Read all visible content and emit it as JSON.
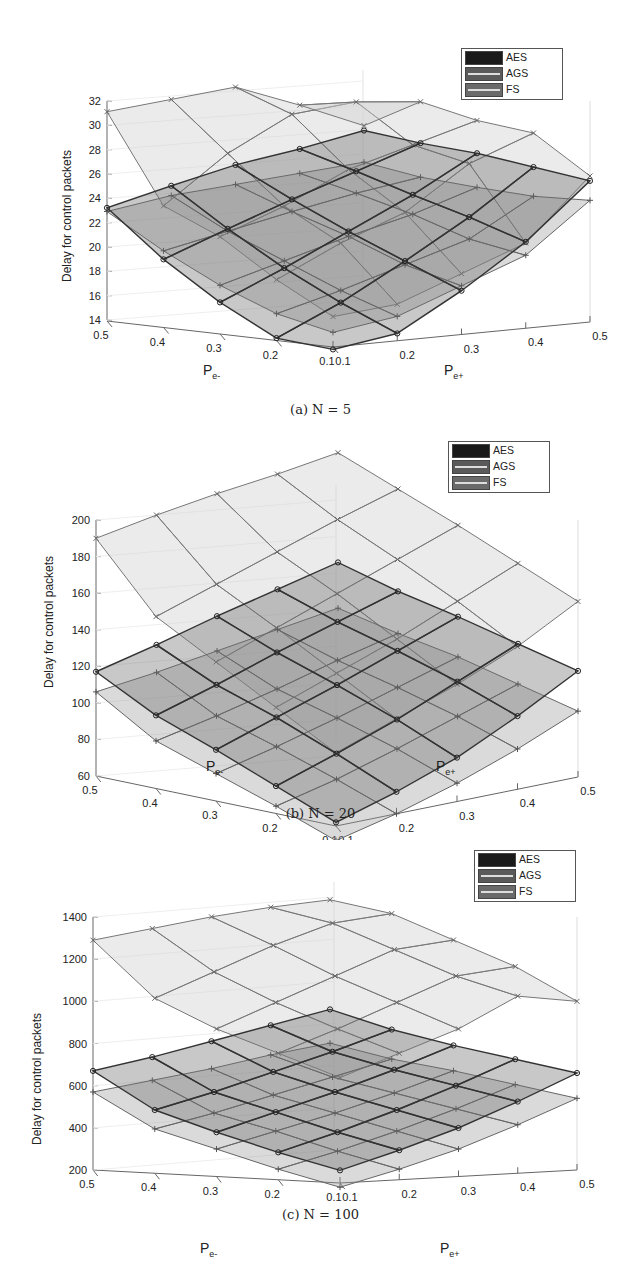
{
  "figure": {
    "panels": [
      {
        "caption": "(a) N = 5",
        "zlabel": "Delay for control packets",
        "xlabel": "P",
        "xlabel_sub": "e-",
        "ylabel": "P",
        "ylabel_sub": "e+",
        "zticks": [
          "32",
          "30",
          "28",
          "26",
          "24",
          "22",
          "20",
          "18",
          "16",
          "14"
        ],
        "xticks": [
          "0.5",
          "0.4",
          "0.3",
          "0.2",
          "0.1"
        ],
        "yticks": [
          "0.1",
          "0.2",
          "0.3",
          "0.4",
          "0.5"
        ],
        "legend": [
          "AES",
          "AGS",
          "FS"
        ]
      },
      {
        "caption": "(b) N = 20",
        "zlabel": "Delay for control packets",
        "xlabel": "P",
        "xlabel_sub": "e-",
        "ylabel": "P",
        "ylabel_sub": "e+",
        "zticks": [
          "200",
          "180",
          "160",
          "140",
          "120",
          "100",
          "80",
          "60"
        ],
        "xticks": [
          "0.5",
          "0.4",
          "0.3",
          "0.2",
          "0.1"
        ],
        "yticks": [
          "0.1",
          "0.2",
          "0.3",
          "0.4",
          "0.5"
        ],
        "legend": [
          "AES",
          "AGS",
          "FS"
        ]
      },
      {
        "caption": "(c) N = 100",
        "zlabel": "Delay for control packets",
        "xlabel": "P",
        "xlabel_sub": "e-",
        "ylabel": "P",
        "ylabel_sub": "e+",
        "zticks": [
          "1400",
          "1200",
          "1000",
          "800",
          "600",
          "400",
          "200"
        ],
        "xticks": [
          "0.5",
          "0.4",
          "0.3",
          "0.2",
          "0.1"
        ],
        "yticks": [
          "0.1",
          "0.2",
          "0.3",
          "0.4",
          "0.5"
        ],
        "legend": [
          "AES",
          "AGS",
          "FS"
        ]
      }
    ]
  },
  "chart_data": [
    {
      "type": "surface3d",
      "title": "(a) N = 5",
      "xlabel": "P_e-",
      "ylabel": "P_e+",
      "zlabel": "Delay for control packets",
      "x": [
        0.1,
        0.2,
        0.3,
        0.4,
        0.5
      ],
      "y": [
        0.1,
        0.2,
        0.3,
        0.4,
        0.5
      ],
      "zlim": [
        14,
        32
      ],
      "legend_position": "top-right",
      "grid": true,
      "series": [
        {
          "name": "AES",
          "marker": "o",
          "color": "#555555",
          "z": [
            [
              13.8,
              14.6,
              17.6,
              21.1,
              25.6
            ],
            [
              14.2,
              16.6,
              19.5,
              22.6,
              26.2
            ],
            [
              16.6,
              18.9,
              21.4,
              23.9,
              26.8
            ],
            [
              19.6,
              21.6,
              23.5,
              25.3,
              27.1
            ],
            [
              23.3,
              24.6,
              25.8,
              26.6,
              27.6
            ]
          ]
        },
        {
          "name": "AGS",
          "marker": "+",
          "color": "#777777",
          "z": [
            [
              15.2,
              16.0,
              18.0,
              20.0,
              24.0
            ],
            [
              16.2,
              17.6,
              19.2,
              20.8,
              23.8
            ],
            [
              18.0,
              19.5,
              21.0,
              22.3,
              24.0
            ],
            [
              20.3,
              21.4,
              22.5,
              23.5,
              24.3
            ],
            [
              23.0,
              23.8,
              24.2,
              24.6,
              25.0
            ]
          ]
        },
        {
          "name": "FS",
          "marker": "x",
          "color": "#888888",
          "z": [
            [
              16.5,
              17.0,
              19.0,
              21.0,
              26.0
            ],
            [
              19.0,
              21.5,
              23.5,
              27.0,
              29.0
            ],
            [
              22.0,
              24.0,
              26.5,
              28.0,
              29.5
            ],
            [
              24.0,
              27.8,
              30.5,
              31.0,
              30.5
            ],
            [
              31.2,
              31.7,
              32.2,
              30.2,
              28.0
            ]
          ]
        }
      ]
    },
    {
      "type": "surface3d",
      "title": "(b) N = 20",
      "xlabel": "P_e-",
      "ylabel": "P_e+",
      "zlabel": "Delay for control packets",
      "x": [
        0.1,
        0.2,
        0.3,
        0.4,
        0.5
      ],
      "y": [
        0.1,
        0.2,
        0.3,
        0.4,
        0.5
      ],
      "zlim": [
        60,
        200
      ],
      "legend_position": "top-right",
      "grid": true,
      "series": [
        {
          "name": "AES",
          "marker": "o",
          "color": "#555555",
          "z": [
            [
              62,
              72,
              84,
              100,
              118
            ],
            [
              75,
              86,
              98,
              112,
              126
            ],
            [
              88,
              99,
              110,
              122,
              134
            ],
            [
              100,
              110,
              121,
              131,
              141
            ],
            [
              117,
              125,
              134,
              142,
              150
            ]
          ]
        },
        {
          "name": "AGS",
          "marker": "+",
          "color": "#777777",
          "z": [
            [
              52,
              60,
              70,
              82,
              96
            ],
            [
              64,
              72,
              82,
              93,
              104
            ],
            [
              75,
              83,
              92,
              102,
              112
            ],
            [
              86,
              93,
              101,
              110,
              118
            ],
            [
              106,
              110,
              115,
              120,
              125
            ]
          ]
        },
        {
          "name": "FS",
          "marker": "x",
          "color": "#888888",
          "z": [
            [
              100,
              112,
              124,
              138,
              156
            ],
            [
              118,
              130,
              142,
              156,
              170
            ],
            [
              136,
              148,
              160,
              172,
              184
            ],
            [
              154,
              165,
              176,
              187,
              197
            ],
            [
              190,
              196,
              201,
              205,
              210
            ]
          ]
        }
      ]
    },
    {
      "type": "surface3d",
      "title": "(c) N = 100",
      "xlabel": "P_e-",
      "ylabel": "P_e+",
      "zlabel": "Delay for control packets",
      "x": [
        0.1,
        0.2,
        0.3,
        0.4,
        0.5
      ],
      "y": [
        0.1,
        0.2,
        0.3,
        0.4,
        0.5
      ],
      "zlim": [
        200,
        1400
      ],
      "legend_position": "top-right",
      "grid": true,
      "series": [
        {
          "name": "AES",
          "marker": "o",
          "color": "#555555",
          "z": [
            [
              260,
              340,
              430,
              540,
              660
            ],
            [
              330,
              410,
              500,
              600,
              710
            ],
            [
              410,
              490,
              570,
              660,
              760
            ],
            [
              500,
              570,
              650,
              730,
              820
            ],
            [
              670,
              720,
              780,
              840,
              900
            ]
          ]
        },
        {
          "name": "AGS",
          "marker": "+",
          "color": "#777777",
          "z": [
            [
              180,
              250,
              330,
              430,
              540
            ],
            [
              250,
              320,
              400,
              490,
              590
            ],
            [
              330,
              400,
              470,
              550,
              640
            ],
            [
              410,
              470,
              540,
              610,
              680
            ],
            [
              570,
              610,
              650,
              700,
              740
            ]
          ]
        },
        {
          "name": "FS",
          "marker": "x",
          "color": "#888888",
          "z": [
            [
              700,
              800,
              900,
              1040,
              1000
            ],
            [
              800,
              900,
              1010,
              1120,
              1150
            ],
            [
              900,
              1010,
              1120,
              1230,
              1260
            ],
            [
              1030,
              1140,
              1250,
              1340,
              1370
            ],
            [
              1290,
              1330,
              1370,
              1400,
              1420
            ]
          ]
        }
      ]
    }
  ]
}
